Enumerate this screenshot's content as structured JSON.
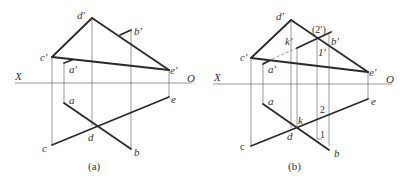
{
  "figures": [
    {
      "caption": "(a)",
      "axis": {
        "left": "X",
        "right": "O"
      },
      "labels": {
        "d_prime": "d′",
        "b_prime": "b′",
        "c_prime": "c′",
        "a_prime": "a′",
        "e_prime": "e′",
        "a": "a",
        "e": "e",
        "d": "d",
        "c": "c",
        "b": "b"
      }
    },
    {
      "caption": "(b)",
      "axis": {
        "left": "X",
        "right": "O"
      },
      "labels": {
        "d_prime": "d′",
        "b_prime": "b′",
        "c_prime": "c′",
        "a_prime": "a′",
        "e_prime": "e′",
        "k_prime": "k′",
        "two_prime": "(2′)",
        "one_prime": "1′",
        "a": "a",
        "e": "e",
        "d": "d",
        "c": "c",
        "b": "b",
        "k": "k",
        "two": "2",
        "one": "1"
      }
    }
  ]
}
